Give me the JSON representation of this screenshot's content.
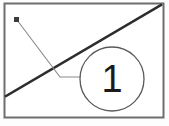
{
  "figure": {
    "type": "technical-callout-diagram",
    "background_color": "#fdfdfd",
    "frame": {
      "name": "drawing-frame",
      "x": 4.5,
      "y": 3.5,
      "width": 159,
      "height": 114,
      "stroke": "#6e6e6e",
      "stroke_width": 2,
      "fill": "#ffffff"
    },
    "diagonal_line": {
      "name": "diagonal-edge-line",
      "x1": 6,
      "y1": 96,
      "x2": 161,
      "y2": 5,
      "stroke": "#2d2d2d",
      "stroke_width": 2.4
    },
    "leader": {
      "name": "leader-line",
      "stroke": "#8a8a8a",
      "stroke_width": 1.1,
      "points": "17,20 60,77 81,77",
      "segments": [
        {
          "x1": 17,
          "y1": 20,
          "x2": 60,
          "y2": 77
        },
        {
          "x1": 60,
          "y1": 77,
          "x2": 81,
          "y2": 77
        }
      ]
    },
    "leader_dot": {
      "name": "leader-origin-dot",
      "shape": "square",
      "x": 14,
      "y": 17,
      "size": 5,
      "fill": "#3c3c3c"
    },
    "balloon": {
      "name": "callout-balloon",
      "cx": 112,
      "cy": 79,
      "r": 32,
      "stroke": "#5a5a5a",
      "stroke_width": 1.3,
      "fill": "#ffffff",
      "label": "1",
      "label_color": "#1b1b1b"
    }
  }
}
